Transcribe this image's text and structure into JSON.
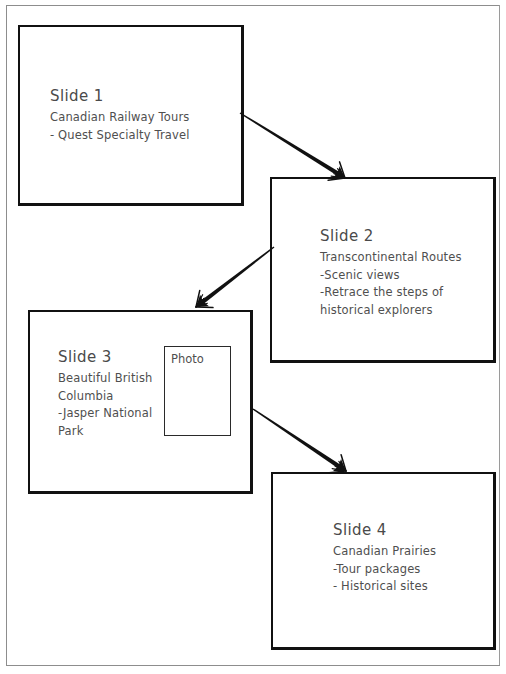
{
  "page": {
    "cut_off_text_top": "",
    "background_color": "#ffffff",
    "border_color": "#8d8d8d",
    "ink_color": "#111111",
    "text_color": "#4f4f4f"
  },
  "slides": [
    {
      "id": "slide-1",
      "title": "Slide 1",
      "body": "Canadian Railway Tours\n- Quest Specialty Travel",
      "lines": [
        "Canadian Railway Tours",
        "- Quest Specialty Travel"
      ]
    },
    {
      "id": "slide-2",
      "title": "Slide 2",
      "body": "Transcontinental Routes\n-Scenic views\n-Retrace the steps of\nhistorical explorers",
      "lines": [
        "Transcontinental Routes",
        "-Scenic views",
        "-Retrace the steps of",
        "historical explorers"
      ]
    },
    {
      "id": "slide-3",
      "title": "Slide 3",
      "body": "Beautiful British\nColumbia\n-Jasper National\nPark",
      "lines": [
        "Beautiful British",
        "Columbia",
        "-Jasper National",
        "Park"
      ],
      "photo_placeholder_label": "Photo"
    },
    {
      "id": "slide-4",
      "title": "Slide 4",
      "body": "Canadian Prairies\n-Tour packages\n- Historical sites",
      "lines": [
        "Canadian Prairies",
        "-Tour packages",
        "- Historical sites"
      ]
    }
  ],
  "arrows": [
    {
      "name": "arrow-slide1-to-slide2",
      "from": "slide-1",
      "to": "slide-2",
      "x1": 240,
      "y1": 113,
      "x2": 345,
      "y2": 178
    },
    {
      "name": "arrow-slide2-to-slide3",
      "from": "slide-2",
      "to": "slide-3",
      "x1": 274,
      "y1": 247,
      "x2": 196,
      "y2": 307
    },
    {
      "name": "arrow-slide3-to-slide4",
      "from": "slide-3",
      "to": "slide-4",
      "x1": 253,
      "y1": 409,
      "x2": 346,
      "y2": 471
    }
  ]
}
